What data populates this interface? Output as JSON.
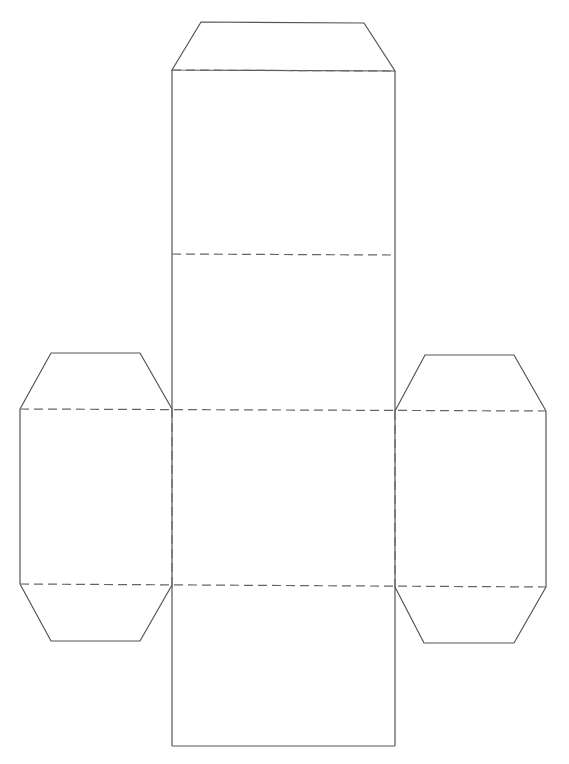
{
  "diagram": {
    "type": "box-net",
    "colors": {
      "background": "#ffffff",
      "cut_line": "#555555",
      "fold_line": "#666666"
    },
    "line_styles": {
      "cut": "solid",
      "fold": "dashed"
    },
    "panels": [
      {
        "id": "top-tab",
        "shape": "trapezoid"
      },
      {
        "id": "panel-1",
        "shape": "rectangle"
      },
      {
        "id": "panel-2",
        "shape": "rectangle"
      },
      {
        "id": "panel-center",
        "shape": "rectangle"
      },
      {
        "id": "panel-bottom",
        "shape": "rectangle"
      },
      {
        "id": "left-panel",
        "shape": "rectangle"
      },
      {
        "id": "left-top-tab",
        "shape": "trapezoid"
      },
      {
        "id": "left-bottom-tab",
        "shape": "trapezoid"
      },
      {
        "id": "right-panel",
        "shape": "rectangle"
      },
      {
        "id": "right-top-tab",
        "shape": "trapezoid"
      },
      {
        "id": "right-bottom-tab",
        "shape": "trapezoid"
      }
    ]
  }
}
